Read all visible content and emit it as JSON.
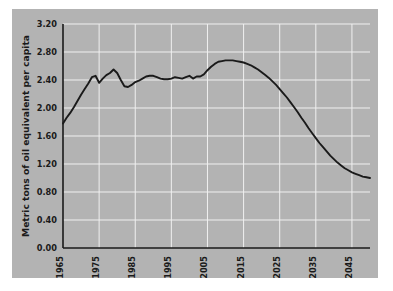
{
  "chart_data": {
    "type": "line",
    "title": "",
    "xlabel": "",
    "ylabel": "Metric tons of oil equivalent per capita",
    "xlim": [
      1965,
      2050
    ],
    "ylim": [
      0.0,
      3.2
    ],
    "grid": true,
    "legend": null,
    "line_color": "#1a1a1a",
    "background_color": "#b3b3b3",
    "grid_color": "#f0f0f0",
    "xticks": [
      "1965",
      "1975",
      "1985",
      "1995",
      "2005",
      "2015",
      "2025",
      "2035",
      "2045"
    ],
    "xtick_values": [
      1965,
      1975,
      1985,
      1995,
      2005,
      2015,
      2025,
      2035,
      2045
    ],
    "yticks": [
      "0.00",
      "0.40",
      "0.80",
      "1.20",
      "1.60",
      "2.00",
      "2.40",
      "2.80",
      "3.20"
    ],
    "ytick_values": [
      0.0,
      0.4,
      0.8,
      1.2,
      1.6,
      2.0,
      2.4,
      2.8,
      3.2
    ],
    "x": [
      1965,
      1966,
      1967,
      1968,
      1969,
      1970,
      1971,
      1972,
      1973,
      1974,
      1975,
      1976,
      1977,
      1978,
      1979,
      1980,
      1981,
      1982,
      1983,
      1984,
      1985,
      1986,
      1987,
      1988,
      1989,
      1990,
      1991,
      1992,
      1993,
      1994,
      1995,
      1996,
      1997,
      1998,
      1999,
      2000,
      2001,
      2002,
      2003,
      2004,
      2005,
      2006,
      2007,
      2008,
      2009,
      2010,
      2011,
      2012,
      2013,
      2014,
      2015,
      2016,
      2017,
      2018,
      2019,
      2020,
      2021,
      2022,
      2023,
      2024,
      2025,
      2026,
      2027,
      2028,
      2029,
      2030,
      2031,
      2032,
      2033,
      2034,
      2035,
      2036,
      2037,
      2038,
      2039,
      2040,
      2041,
      2042,
      2043,
      2044,
      2045,
      2046,
      2047,
      2048,
      2049,
      2050
    ],
    "values": [
      1.78,
      1.86,
      1.93,
      2.01,
      2.1,
      2.19,
      2.27,
      2.35,
      2.44,
      2.46,
      2.36,
      2.42,
      2.47,
      2.5,
      2.55,
      2.5,
      2.4,
      2.31,
      2.3,
      2.33,
      2.37,
      2.39,
      2.42,
      2.45,
      2.46,
      2.46,
      2.44,
      2.42,
      2.41,
      2.41,
      2.42,
      2.44,
      2.43,
      2.42,
      2.44,
      2.46,
      2.42,
      2.45,
      2.45,
      2.48,
      2.54,
      2.59,
      2.63,
      2.66,
      2.67,
      2.68,
      2.68,
      2.68,
      2.67,
      2.66,
      2.65,
      2.63,
      2.61,
      2.58,
      2.55,
      2.51,
      2.47,
      2.43,
      2.38,
      2.33,
      2.27,
      2.21,
      2.15,
      2.08,
      2.01,
      1.94,
      1.86,
      1.79,
      1.71,
      1.64,
      1.57,
      1.5,
      1.44,
      1.38,
      1.32,
      1.27,
      1.22,
      1.18,
      1.14,
      1.11,
      1.08,
      1.06,
      1.04,
      1.02,
      1.01,
      1.0
    ]
  },
  "axes": {
    "y_axis_title": "Metric tons of oil equivalent per capita"
  }
}
